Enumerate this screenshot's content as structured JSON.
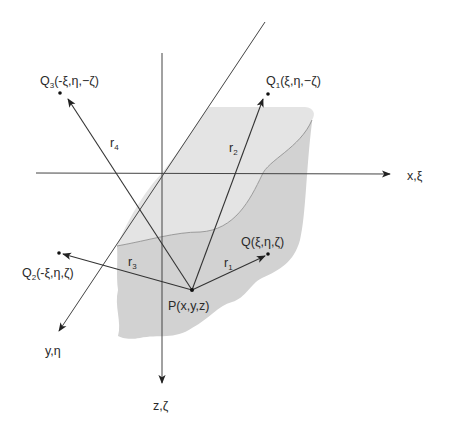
{
  "figure": {
    "type": "image-method geometry diagram",
    "colors": {
      "background": "#ffffff",
      "body_top_face": "#e4e4e4",
      "body_front_face": "#d2d2d2",
      "lines": "#3a3a3a",
      "text": "#2a2a2a"
    }
  },
  "axes": {
    "x": {
      "label": "x,ξ"
    },
    "y": {
      "label": "y,η"
    },
    "z": {
      "label": "z,ζ"
    }
  },
  "points": {
    "P": {
      "name": "P",
      "label": "P(x,y,z)"
    },
    "Q": {
      "name": "Q",
      "label": "Q(ξ,η,ζ)"
    },
    "Q1": {
      "name": "Q",
      "sub": "1",
      "coords": "(ξ,η,−ζ)"
    },
    "Q2": {
      "name": "Q",
      "sub": "2",
      "coords": "(-ξ,η,ζ)"
    },
    "Q3": {
      "name": "Q",
      "sub": "3",
      "coords": "(-ξ,η,−ζ)"
    }
  },
  "vectors": {
    "r1": {
      "name": "r",
      "sub": "1",
      "from": "P",
      "to": "Q"
    },
    "r2": {
      "name": "r",
      "sub": "2",
      "from": "P",
      "to": "Q1"
    },
    "r3": {
      "name": "r",
      "sub": "3",
      "from": "P",
      "to": "Q2"
    },
    "r4": {
      "name": "r",
      "sub": "4",
      "from": "P",
      "to": "Q3"
    }
  }
}
